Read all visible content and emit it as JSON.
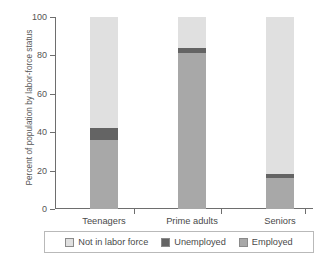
{
  "chart_data": {
    "type": "bar",
    "stacked": true,
    "title": "",
    "xlabel": "",
    "ylabel": "Percent of population by labor-force status",
    "ylim": [
      0,
      100
    ],
    "yticks": [
      0,
      20,
      40,
      60,
      80,
      100
    ],
    "ytick_labels": [
      "0",
      "20",
      "40",
      "60",
      "80",
      "100"
    ],
    "grid": false,
    "legend_position": "bottom",
    "categories": [
      "Teenagers",
      "Prime adults",
      "Seniors"
    ],
    "series": [
      {
        "name": "Employed",
        "color": "#a8a8a8",
        "values": [
          36,
          81,
          16
        ]
      },
      {
        "name": "Unemployed",
        "color": "#646464",
        "values": [
          6,
          3,
          2
        ]
      },
      {
        "name": "Not in labor force",
        "color": "#e0e0e0",
        "values": [
          58,
          16,
          82
        ]
      }
    ],
    "stack_order_bottom_to_top": [
      "Employed",
      "Unemployed",
      "Not in labor force"
    ],
    "legend_order": [
      "Not in labor force",
      "Unemployed",
      "Employed"
    ]
  },
  "axis": {
    "line_color": "#6e6e6e",
    "tick_color": "#6e6e6e"
  },
  "legend": {
    "items": [
      {
        "label": "Not in labor force",
        "color": "#e0e0e0"
      },
      {
        "label": "Unemployed",
        "color": "#646464"
      },
      {
        "label": "Employed",
        "color": "#a8a8a8"
      }
    ]
  }
}
